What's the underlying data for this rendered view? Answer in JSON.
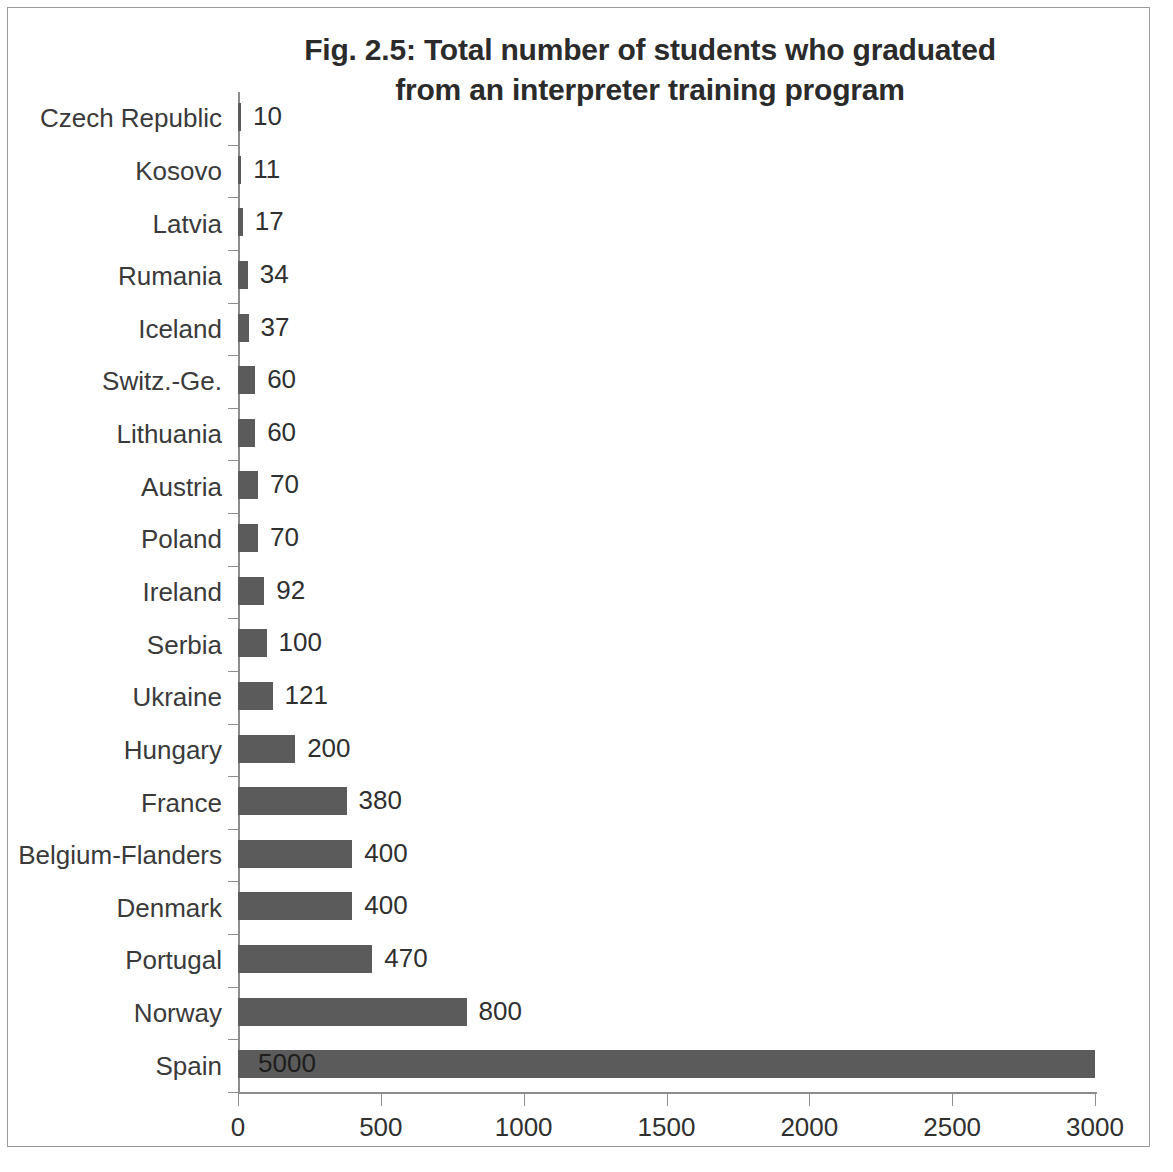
{
  "chart_data": {
    "type": "bar",
    "orientation": "horizontal",
    "title": "Fig. 2.5: Total number of students who graduated from an interpreter training program",
    "title_lines": [
      "Fig. 2.5: Total number of students who graduated",
      "from an interpreter training program"
    ],
    "xlabel": "",
    "ylabel": "",
    "xlim": [
      0,
      3000
    ],
    "xticks": [
      0,
      500,
      1000,
      1500,
      2000,
      2500,
      3000
    ],
    "xtick_labels": [
      "0",
      "500",
      "1000",
      "1500",
      "2000",
      "2500",
      "3000"
    ],
    "grid": false,
    "legend": false,
    "bar_color": "#5b5b5b",
    "categories": [
      "Czech Republic",
      "Kosovo",
      "Latvia",
      "Rumania",
      "Iceland",
      "Switz.-Ge.",
      "Lithuania",
      "Austria",
      "Poland",
      "Ireland",
      "Serbia",
      "Ukraine",
      "Hungary",
      "France",
      "Belgium-Flanders",
      "Denmark",
      "Portugal",
      "Norway",
      "Spain"
    ],
    "values": [
      10,
      11,
      17,
      34,
      37,
      60,
      60,
      70,
      70,
      92,
      100,
      121,
      200,
      380,
      400,
      400,
      470,
      800,
      5000
    ],
    "data_labels": [
      "10",
      "11",
      "17",
      "34",
      "37",
      "60",
      "60",
      "70",
      "70",
      "92",
      "100",
      "121",
      "200",
      "380",
      "400",
      "400",
      "470",
      "800",
      "5000"
    ]
  }
}
